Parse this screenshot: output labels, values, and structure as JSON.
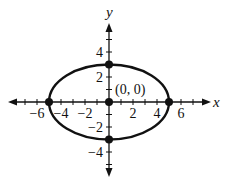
{
  "diagram": {
    "type": "ellipse-graph",
    "equation_form": "x^2/25 + y^2/9 = 1",
    "center": {
      "x": 0,
      "y": 0,
      "label": "(0, 0)"
    },
    "semi_major_axis": 5,
    "semi_minor_axis": 3,
    "points": [
      {
        "x": 0,
        "y": 0
      },
      {
        "x": -5,
        "y": 0
      },
      {
        "x": 5,
        "y": 0
      },
      {
        "x": 0,
        "y": 3
      },
      {
        "x": 0,
        "y": -3
      }
    ],
    "x_axis": {
      "label": "x",
      "tick_labels": [
        "−6",
        "−4",
        "−2",
        "2",
        "4",
        "6"
      ],
      "range": [
        -7,
        8
      ]
    },
    "y_axis": {
      "label": "y",
      "tick_labels": [
        "4",
        "2",
        "−2",
        "−4"
      ],
      "range": [
        -6,
        6
      ]
    },
    "colors": {
      "curve": "#111111",
      "axes": "#111111",
      "background": "#ffffff"
    }
  }
}
